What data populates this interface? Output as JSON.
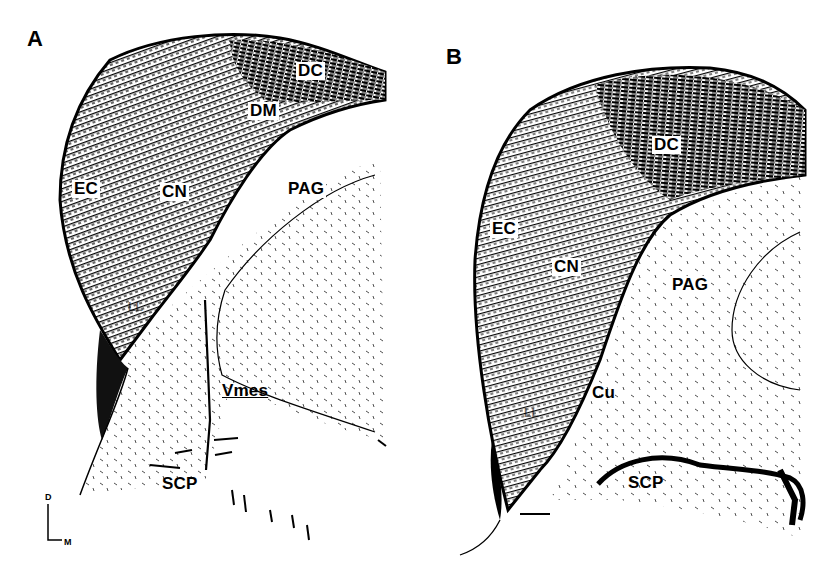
{
  "figure": {
    "panels": [
      {
        "id": "A",
        "letter": "A",
        "labels": {
          "dc": "DC",
          "dm": "DM",
          "ec": "EC",
          "cn": "CN",
          "pag": "PAG",
          "ll": "LL",
          "vmes": "Vmes",
          "scp": "SCP"
        },
        "orientation": {
          "dorsal": "D",
          "medial": "M"
        }
      },
      {
        "id": "B",
        "letter": "B",
        "labels": {
          "dc": "DC",
          "ec": "EC",
          "cn": "CN",
          "pag": "PAG",
          "ll": "LL",
          "cu": "Cu",
          "scp": "SCP"
        },
        "scale_bar": true
      }
    ]
  }
}
